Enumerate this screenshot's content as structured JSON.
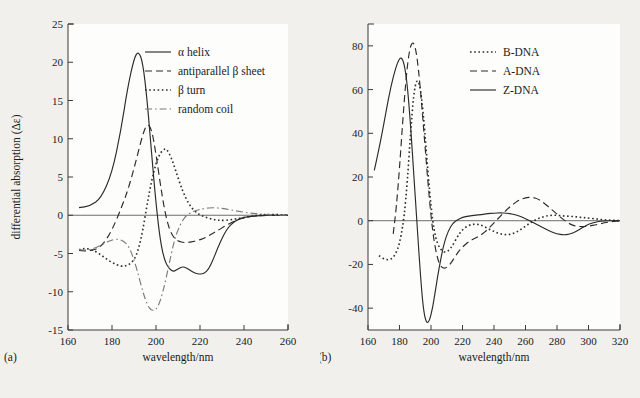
{
  "figure": {
    "background_color": "#f1f0ed",
    "plot_background_color": "#fdfdfc",
    "axis_color": "#3a3a3a",
    "curve_color": "#2b2b2b",
    "accent_gray": "#7a7a7a"
  },
  "panel_a": {
    "label": "(a)",
    "xlabel": "wavelength/nm",
    "ylabel": "differential absorption (Δε)",
    "legend": [
      {
        "label": "α helix",
        "style": "solid"
      },
      {
        "label": "antiparallel β sheet",
        "style": "dashed"
      },
      {
        "label": "β turn",
        "style": "dotted"
      },
      {
        "label": "random coil",
        "style": "dashdot"
      }
    ],
    "xticks": [
      160,
      180,
      200,
      220,
      240,
      260
    ],
    "yticks": [
      -15,
      -10,
      -5,
      0,
      5,
      10,
      15,
      20,
      25
    ]
  },
  "panel_b": {
    "label": "(b)",
    "xlabel": "wavelength/nm",
    "ylabel": "differential absorption (Δε)",
    "legend": [
      {
        "label": "B-DNA",
        "style": "dotted"
      },
      {
        "label": "A-DNA",
        "style": "dashed"
      },
      {
        "label": "Z-DNA",
        "style": "solid"
      }
    ],
    "xticks": [
      160,
      180,
      200,
      220,
      240,
      260,
      280,
      300,
      320
    ],
    "yticks": [
      -40,
      -20,
      0,
      20,
      40,
      60,
      80
    ]
  },
  "chart_data": [
    {
      "type": "line",
      "title": "(a)",
      "xlabel": "wavelength/nm",
      "ylabel": "differential absorption (Δε)",
      "xlim": [
        160,
        260
      ],
      "ylim": [
        -15,
        25
      ],
      "grid": false,
      "legend_position": "top-right",
      "series": [
        {
          "name": "α helix",
          "style": "solid",
          "x": [
            165,
            170,
            175,
            180,
            184,
            187,
            190,
            192,
            194,
            196,
            198,
            200,
            202,
            204,
            206,
            208,
            210,
            212,
            214,
            216,
            218,
            220,
            222,
            224,
            226,
            228,
            232,
            236,
            240,
            245,
            250,
            255,
            260
          ],
          "y": [
            1.0,
            1.2,
            2.2,
            5.5,
            11.0,
            16.5,
            20.5,
            21.5,
            20.0,
            15.0,
            8.0,
            1.5,
            -3.5,
            -6.0,
            -7.0,
            -7.4,
            -7.0,
            -6.7,
            -6.9,
            -7.3,
            -7.6,
            -7.7,
            -7.6,
            -7.0,
            -5.8,
            -4.3,
            -1.8,
            -0.7,
            -0.25,
            -0.1,
            0.0,
            0.0,
            0.0
          ]
        },
        {
          "name": "antiparallel β sheet",
          "style": "dashed",
          "x": [
            165,
            170,
            175,
            180,
            185,
            188,
            191,
            194,
            196,
            198,
            200,
            202,
            204,
            206,
            208,
            210,
            213,
            216,
            219,
            222,
            225,
            228,
            232,
            236,
            240,
            245,
            250,
            255,
            260
          ],
          "y": [
            -4.6,
            -4.7,
            -4.2,
            -2.0,
            1.5,
            4.0,
            7.2,
            10.6,
            12.0,
            11.3,
            8.0,
            4.0,
            0.5,
            -1.8,
            -2.9,
            -3.4,
            -3.6,
            -3.5,
            -3.3,
            -3.0,
            -2.5,
            -2.0,
            -1.3,
            -0.7,
            -0.3,
            -0.1,
            0.0,
            0.0,
            0.0
          ]
        },
        {
          "name": "β turn",
          "style": "dotted",
          "x": [
            165,
            168,
            172,
            176,
            180,
            184,
            187,
            190,
            192,
            194,
            196,
            198,
            200,
            202,
            204,
            205,
            207,
            209,
            212,
            215,
            218,
            221,
            224,
            227,
            230,
            234,
            238,
            242,
            246,
            250,
            255,
            260
          ],
          "y": [
            -4.5,
            -4.3,
            -4.6,
            -5.4,
            -6.2,
            -6.7,
            -6.6,
            -5.9,
            -4.5,
            -2.0,
            1.5,
            4.5,
            6.8,
            8.2,
            8.7,
            8.6,
            7.5,
            5.8,
            3.2,
            1.4,
            0.4,
            -0.1,
            -0.4,
            -0.6,
            -0.7,
            -0.6,
            -0.4,
            -0.2,
            0.0,
            0.1,
            0.1,
            0.0
          ]
        },
        {
          "name": "random coil",
          "style": "dashdot",
          "x": [
            165,
            169,
            173,
            177,
            180,
            183,
            186,
            188,
            190,
            192,
            194,
            196,
            198,
            200,
            202,
            204,
            206,
            208,
            210,
            213,
            216,
            219,
            222,
            226,
            230,
            234,
            238,
            242,
            246,
            250,
            255,
            260
          ],
          "y": [
            -4.5,
            -4.6,
            -4.2,
            -3.6,
            -3.2,
            -3.1,
            -3.5,
            -4.3,
            -5.8,
            -7.8,
            -10.0,
            -11.7,
            -12.5,
            -12.4,
            -11.2,
            -9.0,
            -6.3,
            -3.7,
            -1.8,
            -0.2,
            0.4,
            0.7,
            0.9,
            1.0,
            0.9,
            0.7,
            0.5,
            0.3,
            0.2,
            0.1,
            0.0,
            0.0
          ]
        }
      ]
    },
    {
      "type": "line",
      "title": "(b)",
      "xlabel": "wavelength/nm",
      "ylabel": "differential absorption (Δε)",
      "xlim": [
        160,
        320
      ],
      "ylim": [
        -50,
        90
      ],
      "grid": false,
      "legend_position": "top-right",
      "series": [
        {
          "name": "B-DNA",
          "style": "dotted",
          "x": [
            167,
            170,
            173,
            176,
            179,
            181,
            183,
            185,
            187,
            189,
            191,
            193,
            195,
            197,
            199,
            201,
            203,
            205,
            208,
            211,
            214,
            217,
            220,
            224,
            228,
            232,
            236,
            240,
            244,
            248,
            252,
            256,
            260,
            264,
            268,
            272,
            276,
            280,
            284,
            288,
            292,
            296,
            300,
            305,
            310,
            315,
            320
          ],
          "y": [
            -16.0,
            -17.5,
            -18.0,
            -17.0,
            -13.0,
            -7.0,
            2.0,
            18.0,
            40.0,
            58.0,
            65.0,
            62.0,
            50.0,
            32.0,
            14.0,
            0.0,
            -8.0,
            -12.0,
            -14.5,
            -14.0,
            -11.0,
            -7.0,
            -4.0,
            -2.0,
            -1.5,
            -2.0,
            -3.5,
            -5.0,
            -6.0,
            -6.5,
            -6.0,
            -4.5,
            -2.5,
            -0.5,
            1.0,
            2.0,
            2.5,
            2.5,
            2.2,
            2.0,
            1.8,
            1.5,
            1.2,
            0.8,
            0.4,
            0.2,
            0.0
          ]
        },
        {
          "name": "A-DNA",
          "style": "dashed",
          "x": [
            176,
            178,
            180,
            182,
            184,
            186,
            188,
            190,
            192,
            194,
            196,
            198,
            200,
            202,
            205,
            208,
            211,
            214,
            217,
            220,
            224,
            228,
            232,
            236,
            240,
            244,
            248,
            252,
            256,
            260,
            264,
            268,
            272,
            276,
            280,
            284,
            288,
            292,
            296,
            300,
            305,
            310,
            315,
            320
          ],
          "y": [
            -6.0,
            6.0,
            24.0,
            45.0,
            64.0,
            77.0,
            82.0,
            80.0,
            70.0,
            54.0,
            36.0,
            18.0,
            2.0,
            -10.0,
            -20.0,
            -22.0,
            -21.0,
            -18.0,
            -14.5,
            -12.0,
            -9.5,
            -8.0,
            -6.5,
            -4.0,
            -1.0,
            2.0,
            5.0,
            7.5,
            9.5,
            10.5,
            10.8,
            10.0,
            8.0,
            5.5,
            3.0,
            0.5,
            -1.5,
            -2.5,
            -2.8,
            -2.5,
            -1.8,
            -1.0,
            -0.4,
            0.0
          ]
        },
        {
          "name": "Z-DNA",
          "style": "solid",
          "x": [
            164,
            167,
            170,
            173,
            176,
            179,
            181,
            183,
            185,
            187,
            189,
            191,
            193,
            195,
            197,
            199,
            201,
            203,
            205,
            208,
            211,
            214,
            217,
            220,
            224,
            228,
            232,
            236,
            240,
            244,
            248,
            252,
            256,
            260,
            264,
            268,
            272,
            276,
            280,
            284,
            288,
            292,
            296,
            300,
            305,
            310,
            315,
            320
          ],
          "y": [
            23.0,
            33.0,
            44.0,
            56.0,
            66.0,
            73.0,
            75.0,
            72.0,
            62.0,
            44.0,
            22.0,
            0.0,
            -22.0,
            -40.0,
            -47.0,
            -46.0,
            -40.0,
            -31.0,
            -22.0,
            -11.0,
            -4.5,
            -1.0,
            0.5,
            1.5,
            2.2,
            2.5,
            2.8,
            3.2,
            3.5,
            3.6,
            3.5,
            3.0,
            2.2,
            1.0,
            -0.5,
            -2.0,
            -3.5,
            -5.0,
            -6.0,
            -6.5,
            -6.2,
            -5.0,
            -3.2,
            -1.6,
            -0.5,
            0.0,
            0.0,
            0.0
          ]
        }
      ]
    }
  ]
}
